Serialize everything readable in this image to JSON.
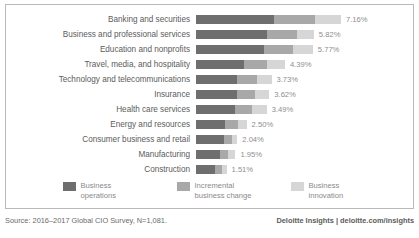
{
  "chart_data": {
    "type": "bar",
    "title": "",
    "xlabel": "",
    "ylabel": "",
    "orientation": "horizontal",
    "stacked": true,
    "grid": false,
    "legend_position": "bottom",
    "xlim": [
      0,
      7.16
    ],
    "categories": [
      "Banking and securities",
      "Business and professional services",
      "Education and nonprofits",
      "Travel, media, and hospitality",
      "Technology and telecommunications",
      "Insurance",
      "Health care services",
      "Energy and resources",
      "Consumer business and retail",
      "Manufacturing",
      "Construction"
    ],
    "series": [
      {
        "name": "Business operations",
        "color": "#6e6e6e",
        "values": [
          3.87,
          3.49,
          3.35,
          2.37,
          2.01,
          2.03,
          1.92,
          1.43,
          1.39,
          1.17,
          0.94
        ]
      },
      {
        "name": "Incremental business change",
        "color": "#a8a8a8",
        "values": [
          2.01,
          1.51,
          1.46,
          1.13,
          0.99,
          0.89,
          0.87,
          0.62,
          0.39,
          0.43,
          0.33
        ]
      },
      {
        "name": "Business innovation",
        "color": "#d6d6d6",
        "values": [
          1.28,
          0.82,
          0.96,
          0.89,
          0.73,
          0.7,
          0.7,
          0.45,
          0.26,
          0.35,
          0.24
        ]
      }
    ],
    "totals": [
      7.16,
      5.82,
      5.77,
      4.39,
      3.73,
      3.62,
      3.49,
      2.5,
      2.04,
      1.95,
      1.51
    ],
    "total_labels": [
      "7.16%",
      "5.82%",
      "5.77%",
      "4.39%",
      "3.73%",
      "3.62%",
      "3.49%",
      "2.50%",
      "2.04%",
      "1.95%",
      "1.51%"
    ]
  },
  "legend": {
    "items": [
      {
        "label": "Business operations",
        "color": "#6e6e6e"
      },
      {
        "label": "Incremental business change",
        "color": "#a8a8a8"
      },
      {
        "label": "Business innovation",
        "color": "#d6d6d6"
      }
    ]
  },
  "footer": {
    "source": "Source: 2016–2017 Global CIO Survey, N=1,081.",
    "brand": "Deloitte Insights | deloitte.com/insights"
  }
}
